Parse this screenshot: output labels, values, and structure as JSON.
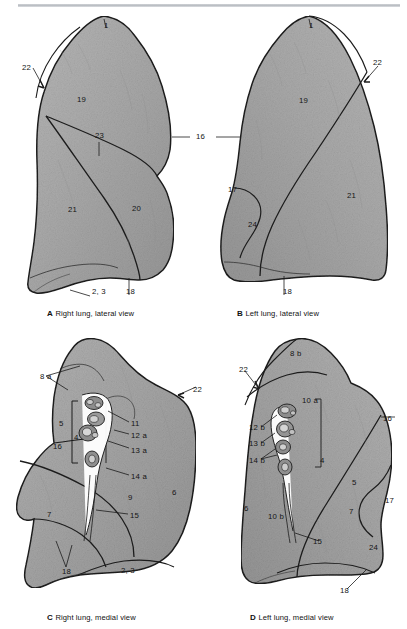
{
  "plate": {
    "title": "Lungs: lateral and medial views",
    "background_color": "#ffffff",
    "rule_color": "#bfc3c8",
    "lung_fill": "#a8a8a8",
    "lung_fill_light": "#bdbdbd",
    "lung_fill_dark": "#8f8f8f",
    "outline_color": "#1c1c1c",
    "label_color": "#151515"
  },
  "panels": [
    {
      "id": "A",
      "letter": "A",
      "caption": "Right lung, lateral view",
      "labels": [
        {
          "name": "label-1",
          "text": "1",
          "x": 104,
          "y": 22
        },
        {
          "name": "label-22",
          "text": "22",
          "x": 22,
          "y": 64
        },
        {
          "name": "label-19",
          "text": "19",
          "x": 77,
          "y": 96
        },
        {
          "name": "label-23",
          "text": "23",
          "x": 95,
          "y": 132
        },
        {
          "name": "label-21",
          "text": "21",
          "x": 68,
          "y": 206
        },
        {
          "name": "label-20",
          "text": "20",
          "x": 132,
          "y": 205
        },
        {
          "name": "label-2-3",
          "text": "2, 3",
          "x": 92,
          "y": 288
        },
        {
          "name": "label-18",
          "text": "18",
          "x": 126,
          "y": 288
        }
      ]
    },
    {
      "id": "B",
      "letter": "B",
      "caption": "Left lung, lateral view",
      "labels": [
        {
          "name": "label-1",
          "text": "1",
          "x": 309,
          "y": 22
        },
        {
          "name": "label-22",
          "text": "22",
          "x": 373,
          "y": 59
        },
        {
          "name": "label-19",
          "text": "19",
          "x": 299,
          "y": 97
        },
        {
          "name": "label-17",
          "text": "17",
          "x": 228,
          "y": 186
        },
        {
          "name": "label-24",
          "text": "24",
          "x": 248,
          "y": 221
        },
        {
          "name": "label-21",
          "text": "21",
          "x": 347,
          "y": 192
        },
        {
          "name": "label-18",
          "text": "18",
          "x": 283,
          "y": 288
        }
      ]
    },
    {
      "id": "C",
      "letter": "C",
      "caption": "Right lung, medial view",
      "labels": [
        {
          "name": "label-8a",
          "text": "8 a",
          "x": 40,
          "y": 373
        },
        {
          "name": "label-22",
          "text": "22",
          "x": 193,
          "y": 386
        },
        {
          "name": "label-5",
          "text": "5",
          "x": 59,
          "y": 420
        },
        {
          "name": "label-4",
          "text": "4",
          "x": 74,
          "y": 434
        },
        {
          "name": "label-16",
          "text": "16",
          "x": 53,
          "y": 443
        },
        {
          "name": "label-11",
          "text": "11",
          "x": 131,
          "y": 420
        },
        {
          "name": "label-12a",
          "text": "12 a",
          "x": 131,
          "y": 432
        },
        {
          "name": "label-13a",
          "text": "13 a",
          "x": 131,
          "y": 447
        },
        {
          "name": "label-14a",
          "text": "14 a",
          "x": 131,
          "y": 473
        },
        {
          "name": "label-9",
          "text": "9",
          "x": 128,
          "y": 494
        },
        {
          "name": "label-6",
          "text": "6",
          "x": 172,
          "y": 489
        },
        {
          "name": "label-7",
          "text": "7",
          "x": 47,
          "y": 511
        },
        {
          "name": "label-15",
          "text": "15",
          "x": 130,
          "y": 512
        },
        {
          "name": "label-18",
          "text": "18",
          "x": 62,
          "y": 568
        },
        {
          "name": "label-2-3",
          "text": "2, 3",
          "x": 121,
          "y": 567
        }
      ]
    },
    {
      "id": "D",
      "letter": "D",
      "caption": "Left lung, medial view",
      "labels": [
        {
          "name": "label-8b",
          "text": "8 b",
          "x": 290,
          "y": 350
        },
        {
          "name": "label-22",
          "text": "22",
          "x": 239,
          "y": 366
        },
        {
          "name": "label-10a",
          "text": "10 a",
          "x": 302,
          "y": 397
        },
        {
          "name": "label-16",
          "text": "16",
          "x": 383,
          "y": 415
        },
        {
          "name": "label-12b",
          "text": "12 b",
          "x": 249,
          "y": 424
        },
        {
          "name": "label-13b",
          "text": "13 b",
          "x": 249,
          "y": 440
        },
        {
          "name": "label-14b",
          "text": "14 b",
          "x": 249,
          "y": 457
        },
        {
          "name": "label-4",
          "text": "4",
          "x": 320,
          "y": 457
        },
        {
          "name": "label-5",
          "text": "5",
          "x": 352,
          "y": 479
        },
        {
          "name": "label-17",
          "text": "17",
          "x": 385,
          "y": 497
        },
        {
          "name": "label-6",
          "text": "6",
          "x": 244,
          "y": 505
        },
        {
          "name": "label-10b",
          "text": "10 b",
          "x": 268,
          "y": 513
        },
        {
          "name": "label-7",
          "text": "7",
          "x": 349,
          "y": 508
        },
        {
          "name": "label-15",
          "text": "15",
          "x": 313,
          "y": 538
        },
        {
          "name": "label-24",
          "text": "24",
          "x": 369,
          "y": 544
        },
        {
          "name": "label-18",
          "text": "18",
          "x": 340,
          "y": 587
        }
      ]
    }
  ]
}
